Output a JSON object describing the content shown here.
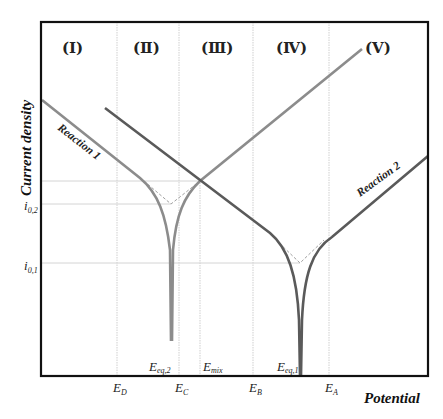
{
  "axes": {
    "y_title": "Current density",
    "x_title": "Potential"
  },
  "regions": [
    {
      "label": "(Ⅰ)"
    },
    {
      "label": "(Ⅱ)"
    },
    {
      "label": "(Ⅲ)"
    },
    {
      "label": "(Ⅳ)"
    },
    {
      "label": "(Ⅴ)"
    }
  ],
  "x_ticks": [
    {
      "main": "E",
      "sub": "D"
    },
    {
      "main": "E",
      "sub": "C"
    },
    {
      "main": "E",
      "sub": "B"
    },
    {
      "main": "E",
      "sub": "A"
    }
  ],
  "x_inline_labels": [
    {
      "main": "E",
      "sub": "eq,2"
    },
    {
      "main": "E",
      "sub": "mix"
    },
    {
      "main": "E",
      "sub": "eq,1"
    }
  ],
  "y_ticks": [
    {
      "main": "i",
      "sub": "0,2"
    },
    {
      "main": "i",
      "sub": "0,1"
    }
  ],
  "curves": [
    {
      "label": "Reaction 1",
      "color": "#8c8c8c"
    },
    {
      "label": "Reaction 2",
      "color": "#5a5a5a"
    }
  ],
  "colors": {
    "frame": "#111111",
    "gridline": "#cfcfcf",
    "dashed": "#a0a0a0"
  }
}
